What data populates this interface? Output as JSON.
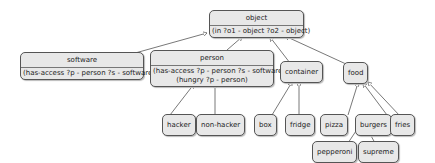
{
  "diagram": {
    "nodes": {
      "object": {
        "title": "object",
        "attrs": [
          "(in ?o1 - object ?o2 - object)"
        ]
      },
      "software": {
        "title": "software",
        "attrs": [
          "(has-access ?p - person ?s - software)"
        ]
      },
      "person": {
        "title": "person",
        "attrs": [
          "(has-access ?p - person ?s - software)",
          "(hungry ?p - person)"
        ]
      },
      "container": {
        "title": "container"
      },
      "food": {
        "title": "food"
      },
      "hacker": {
        "title": "hacker"
      },
      "non_hacker": {
        "title": "non-hacker"
      },
      "box": {
        "title": "box"
      },
      "fridge": {
        "title": "fridge"
      },
      "pizza": {
        "title": "pizza"
      },
      "burgers": {
        "title": "burgers"
      },
      "fries": {
        "title": "fries"
      },
      "pepperoni": {
        "title": "pepperoni"
      },
      "supreme": {
        "title": "supreme"
      }
    },
    "edges": [
      [
        "software",
        "object"
      ],
      [
        "person",
        "object"
      ],
      [
        "container",
        "object"
      ],
      [
        "food",
        "object"
      ],
      [
        "hacker",
        "person"
      ],
      [
        "non_hacker",
        "person"
      ],
      [
        "box",
        "container"
      ],
      [
        "fridge",
        "container"
      ],
      [
        "pizza",
        "food"
      ],
      [
        "burgers",
        "food"
      ],
      [
        "fries",
        "food"
      ],
      [
        "pepperoni",
        "pizza"
      ],
      [
        "supreme",
        "pizza"
      ]
    ]
  }
}
